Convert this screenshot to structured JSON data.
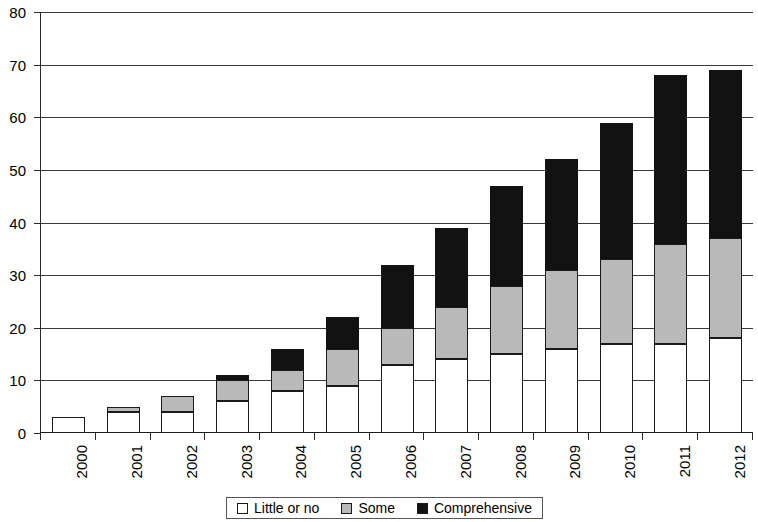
{
  "chart_data": {
    "type": "bar",
    "stacked": true,
    "title": "",
    "subtitle": "",
    "xlabel": "",
    "ylabel": "",
    "ylim": [
      0,
      80
    ],
    "yticks": [
      0,
      10,
      20,
      30,
      40,
      50,
      60,
      70,
      80
    ],
    "ytick_labels": [
      "0",
      "10",
      "20",
      "30",
      "40",
      "50",
      "60",
      "70",
      "80"
    ],
    "grid": true,
    "grid_axis": "y",
    "legend_position": "bottom-center",
    "categories": [
      "2000",
      "2001",
      "2002",
      "2003",
      "2004",
      "2005",
      "2006",
      "2007",
      "2008",
      "2009",
      "2010",
      "2011",
      "2012"
    ],
    "series": [
      {
        "name": "Little or no",
        "color": "#ffffff",
        "values": [
          3,
          4,
          4,
          6,
          8,
          9,
          13,
          14,
          15,
          16,
          17,
          17,
          18
        ]
      },
      {
        "name": "Some",
        "color": "#b9b9b9",
        "values": [
          0,
          1,
          3,
          4,
          4,
          7,
          7,
          10,
          13,
          15,
          16,
          19,
          19
        ]
      },
      {
        "name": "Comprehensive",
        "color": "#121212",
        "values": [
          0,
          0,
          0,
          1,
          4,
          6,
          12,
          15,
          19,
          21,
          26,
          32,
          32
        ]
      }
    ],
    "totals": [
      3,
      5,
      7,
      11,
      16,
      22,
      32,
      39,
      47,
      52,
      59,
      68,
      69
    ]
  },
  "legend": {
    "items": [
      {
        "label": "Little or no",
        "swatch": "white-square-icon"
      },
      {
        "label": "Some",
        "swatch": "gray-square-icon"
      },
      {
        "label": "Comprehensive",
        "swatch": "black-square-icon"
      }
    ]
  },
  "colors": {
    "little_or_no": "#ffffff",
    "some": "#b9b9b9",
    "comprehensive": "#121212",
    "axis": "#2b2b2b",
    "grid": "#3a3a3a",
    "background": "#ffffff"
  }
}
